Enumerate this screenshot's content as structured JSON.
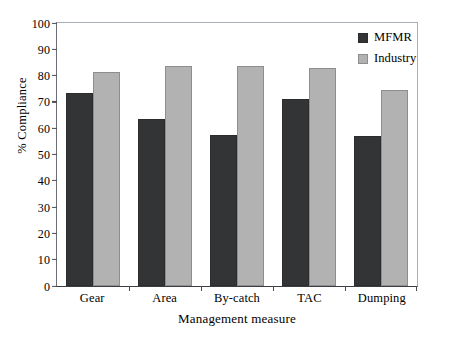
{
  "chart_data": {
    "type": "bar",
    "title": "",
    "xlabel": "Management measure",
    "ylabel": "% Compliance",
    "categories": [
      "Gear",
      "Area",
      "By-catch",
      "TAC",
      "Dumping"
    ],
    "series": [
      {
        "name": "MFMR",
        "color": "#333436",
        "values": [
          73.5,
          63.5,
          57.5,
          71,
          57
        ]
      },
      {
        "name": "Industry",
        "color": "#b2b2b2",
        "values": [
          81.5,
          83.5,
          83.5,
          83,
          74.5
        ]
      }
    ],
    "ylim": [
      0,
      100
    ],
    "yticks": [
      0,
      10,
      20,
      30,
      40,
      50,
      60,
      70,
      80,
      90,
      100
    ],
    "ytick_labels": [
      "0",
      "10",
      "20",
      "30",
      "40",
      "50",
      "60",
      "70",
      "80",
      "90",
      "100"
    ],
    "grid": false,
    "legend_position": "top-right"
  },
  "legend": {
    "items": [
      {
        "label": "MFMR"
      },
      {
        "label": "Industry"
      }
    ]
  }
}
